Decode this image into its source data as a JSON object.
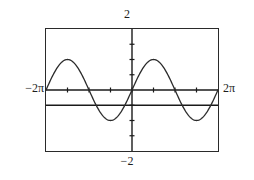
{
  "graph": {
    "x_min_label": "−2π",
    "x_max_label": "2π",
    "y_max_label": "2",
    "y_min_label": "−2",
    "frame_color": "#2a2a2a",
    "axis_color": "#1a1a1a",
    "curve_color": "#2b2b2b",
    "line_color": "#1a1a1a",
    "background": "#ffffff"
  },
  "chart_data": {
    "type": "line",
    "title": "",
    "subtitle": "",
    "xlabel": "",
    "ylabel": "",
    "xlim": [
      -6.283185307,
      6.283185307
    ],
    "ylim": [
      -2,
      2
    ],
    "xtick_labels": [
      "−2π",
      "2π"
    ],
    "ytick_labels": [
      "2",
      "−2"
    ],
    "xticks": [
      -4.71238898,
      -3.141592653,
      -1.570796327,
      0.0,
      1.570796327,
      3.141592653,
      4.71238898
    ],
    "yticks": [
      -1.5,
      -1.0,
      -0.5,
      0.5,
      1.0,
      1.5
    ],
    "grid": false,
    "legend": null,
    "legend_position": "none",
    "axis_style": "calculator-window-with-centered-axes",
    "series": [
      {
        "name": "sine curve",
        "type": "line",
        "expression": "y = sin(x)",
        "amplitude": 1,
        "period": 6.283185307,
        "phase": 0,
        "vertical_shift": 0,
        "x": [
          -6.283185307,
          -5.890486225,
          -5.497787144,
          -5.105088062,
          -4.71238898,
          -4.319689899,
          -3.926990817,
          -3.534291735,
          -3.141592653,
          -2.748893572,
          -2.35619449,
          -1.963495408,
          -1.570796327,
          -1.178097245,
          -0.785398163,
          -0.392699082,
          0.0,
          0.392699082,
          0.785398163,
          1.178097245,
          1.570796327,
          1.963495408,
          2.35619449,
          2.748893572,
          3.141592653,
          3.534291735,
          3.926990817,
          4.319689899,
          4.71238898,
          5.105088062,
          5.497787144,
          5.890486225,
          6.283185307
        ],
        "y": [
          0.0,
          0.382683432,
          0.707106781,
          0.923879533,
          1.0,
          0.923879533,
          0.707106781,
          0.382683432,
          0.0,
          -0.382683432,
          -0.707106781,
          -0.923879533,
          -1.0,
          -0.923879533,
          -0.707106781,
          -0.382683432,
          0.0,
          0.382683432,
          0.707106781,
          0.923879533,
          1.0,
          0.923879533,
          0.707106781,
          0.382683432,
          0.0,
          -0.382683432,
          -0.707106781,
          -0.923879533,
          -1.0,
          -0.923879533,
          -0.707106781,
          -0.382683432,
          0.0
        ],
        "peaks": [
          {
            "x": -4.71238898,
            "y": 1
          },
          {
            "x": 1.570796327,
            "y": 1
          }
        ],
        "troughs": [
          {
            "x": -1.570796327,
            "y": -1
          },
          {
            "x": 4.71238898,
            "y": -1
          }
        ]
      },
      {
        "name": "horizontal line",
        "type": "line",
        "expression": "y = -0.5",
        "constant_y": -0.5,
        "x": [
          -6.283185307,
          6.283185307
        ],
        "y": [
          -0.5,
          -0.5
        ]
      }
    ]
  }
}
